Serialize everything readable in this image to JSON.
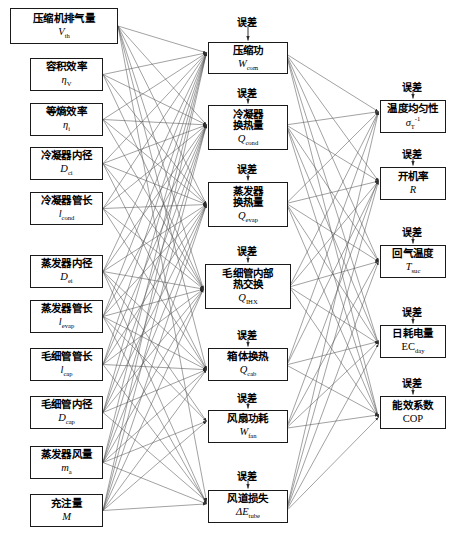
{
  "diagram": {
    "title": "",
    "error_label": "误差",
    "columns": {
      "inputs": {
        "name": "input-parameters",
        "nodes": [
          {
            "id": "Vth",
            "cn": "压缩机排气量",
            "sym": "V",
            "sub": "th",
            "x": 10,
            "y": 8,
            "w": 108,
            "h": 36
          },
          {
            "id": "etaV",
            "cn": "容积效率",
            "sym": "η",
            "sub": "V",
            "x": 30,
            "y": 58,
            "w": 73,
            "h": 33
          },
          {
            "id": "etai",
            "cn": "等熵效率",
            "sym": "η",
            "sub": "i",
            "x": 30,
            "y": 103,
            "w": 73,
            "h": 33
          },
          {
            "id": "Dci",
            "cn": "冷凝器内径",
            "sym": "D",
            "sub": "ci",
            "x": 30,
            "y": 147,
            "w": 73,
            "h": 33
          },
          {
            "id": "lcond",
            "cn": "冷凝器管长",
            "sym": "l",
            "sub": "cond",
            "x": 30,
            "y": 192,
            "w": 73,
            "h": 33
          },
          {
            "id": "Dei",
            "cn": "蒸发器内径",
            "sym": "D",
            "sub": "ei",
            "x": 30,
            "y": 255,
            "w": 73,
            "h": 33
          },
          {
            "id": "levap",
            "cn": "蒸发器管长",
            "sym": "l",
            "sub": "evap",
            "x": 30,
            "y": 300,
            "w": 73,
            "h": 33
          },
          {
            "id": "lcap",
            "cn": "毛细管管长",
            "sym": "l",
            "sub": "cap",
            "x": 30,
            "y": 348,
            "w": 73,
            "h": 33
          },
          {
            "id": "Dcap",
            "cn": "毛细管内径",
            "sym": "D",
            "sub": "cap",
            "x": 30,
            "y": 396,
            "w": 73,
            "h": 33
          },
          {
            "id": "ma",
            "cn": "蒸发器风量",
            "sym": "m",
            "sub": "a",
            "x": 30,
            "y": 446,
            "w": 73,
            "h": 33
          },
          {
            "id": "M",
            "cn": "充注量",
            "sym": "M",
            "sub": "",
            "x": 30,
            "y": 494,
            "w": 73,
            "h": 33
          }
        ]
      },
      "intermediate": {
        "name": "intermediate-quantities",
        "nodes": [
          {
            "id": "Wcom",
            "cn": "压缩功",
            "cn2": "",
            "sym": "W",
            "sub": "com",
            "x": 208,
            "y": 42,
            "w": 80,
            "h": 32,
            "err_y": 14
          },
          {
            "id": "Qcond",
            "cn": "冷凝器",
            "cn2": "换热量",
            "sym": "Q",
            "sub": "cond",
            "x": 208,
            "y": 105,
            "w": 80,
            "h": 45,
            "err_y": 85
          },
          {
            "id": "Qevap",
            "cn": "蒸发器",
            "cn2": "换热量",
            "sym": "Q",
            "sub": "evap",
            "x": 208,
            "y": 182,
            "w": 80,
            "h": 45,
            "err_y": 161
          },
          {
            "id": "QIHX",
            "cn": "毛细管内部",
            "cn2": "热交换",
            "sym": "Q",
            "sub": "IHX",
            "x": 205,
            "y": 264,
            "w": 86,
            "h": 45,
            "err_y": 243
          },
          {
            "id": "Qcab",
            "cn": "箱体换热",
            "cn2": "",
            "sym": "Q",
            "sub": "cab",
            "x": 208,
            "y": 348,
            "w": 80,
            "h": 33,
            "err_y": 327
          },
          {
            "id": "Wfan",
            "cn": "风扇功耗",
            "cn2": "",
            "sym": "W",
            "sub": "fan",
            "x": 208,
            "y": 410,
            "w": 80,
            "h": 33,
            "err_y": 390
          },
          {
            "id": "dEtube",
            "cn": "风道损失",
            "cn2": "",
            "sym": "ΔE",
            "sub": "tube",
            "x": 208,
            "y": 490,
            "w": 80,
            "h": 33,
            "err_y": 468
          }
        ]
      },
      "outputs": {
        "name": "output-indicators",
        "nodes": [
          {
            "id": "sigmaT",
            "cn": "温度均匀性",
            "sym": "σ",
            "sub": "T",
            "sup": "-1",
            "x": 380,
            "y": 100,
            "w": 66,
            "h": 33,
            "err_y": 79
          },
          {
            "id": "R",
            "cn": "开机率",
            "sym": "R",
            "sub": "",
            "x": 380,
            "y": 167,
            "w": 66,
            "h": 33,
            "err_y": 146
          },
          {
            "id": "Tsuc",
            "cn": "回气温度",
            "sym": "T",
            "sub": "suc",
            "x": 380,
            "y": 245,
            "w": 66,
            "h": 33,
            "err_y": 224
          },
          {
            "id": "ECday",
            "cn": "日耗电量",
            "sym": "EC",
            "sub": "day",
            "upright": true,
            "x": 380,
            "y": 325,
            "w": 66,
            "h": 33,
            "err_y": 304
          },
          {
            "id": "COP",
            "cn": "能效系数",
            "sym": "COP",
            "sub": "",
            "upright": true,
            "x": 380,
            "y": 396,
            "w": 66,
            "h": 33,
            "err_y": 375
          }
        ]
      }
    }
  }
}
